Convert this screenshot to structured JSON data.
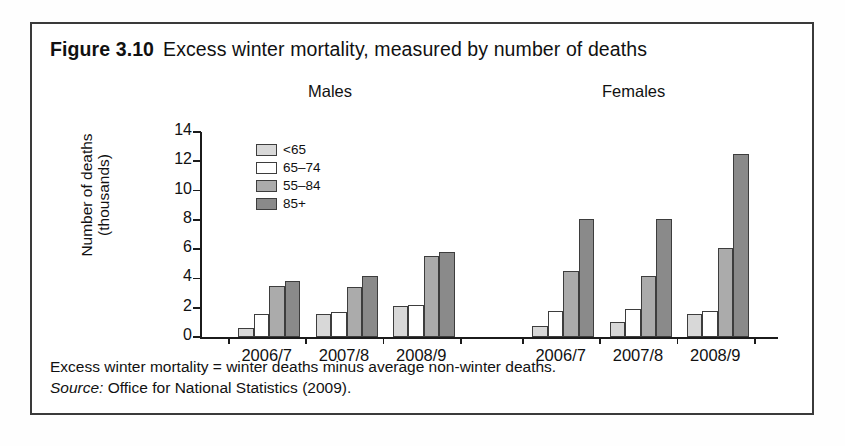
{
  "figure": {
    "number": "Figure 3.10",
    "title": "Excess winter mortality, measured by number of deaths"
  },
  "notes": {
    "definition": "Excess winter mortality = winter deaths minus average non-winter deaths.",
    "source_label": "Source:",
    "source_value": "Office for National Statistics (2009)."
  },
  "chart_data": {
    "type": "bar",
    "title": "Excess winter mortality, measured by number of deaths",
    "xlabel": "",
    "ylabel": "Number of deaths (thousands)",
    "ylim": [
      0,
      14
    ],
    "yticks": [
      0,
      2,
      4,
      6,
      8,
      10,
      12,
      14
    ],
    "ytick_labels": [
      "0",
      "2",
      "4",
      "6",
      "8",
      "10",
      "12",
      "14"
    ],
    "grid": false,
    "legend_position": "upper-left-inside",
    "panels": [
      {
        "name": "Males",
        "categories": [
          "2006/7",
          "2007/8",
          "2008/9"
        ],
        "series": [
          {
            "name": "<65",
            "values": [
              0.6,
              1.6,
              2.1
            ]
          },
          {
            "name": "65–74",
            "values": [
              1.6,
              1.7,
              2.2
            ]
          },
          {
            "name": "55–84",
            "values": [
              3.5,
              3.4,
              5.5
            ]
          },
          {
            "name": "85+",
            "values": [
              3.85,
              4.2,
              5.8
            ]
          }
        ]
      },
      {
        "name": "Females",
        "categories": [
          "2006/7",
          "2007/8",
          "2008/9"
        ],
        "series": [
          {
            "name": "<65",
            "values": [
              0.75,
              1.0,
              1.6
            ]
          },
          {
            "name": "65–74",
            "values": [
              1.8,
              1.9,
              1.8
            ]
          },
          {
            "name": "55–84",
            "values": [
              4.5,
              4.2,
              6.1
            ]
          },
          {
            "name": "85+",
            "values": [
              8.05,
              8.05,
              12.5
            ]
          }
        ]
      }
    ],
    "legend": [
      {
        "label": "<65",
        "color": "#d8d8d8"
      },
      {
        "label": "65–74",
        "color": "#ffffff"
      },
      {
        "label": "55–84",
        "color": "#ababab"
      },
      {
        "label": "85+",
        "color": "#8a8a8a"
      }
    ]
  }
}
